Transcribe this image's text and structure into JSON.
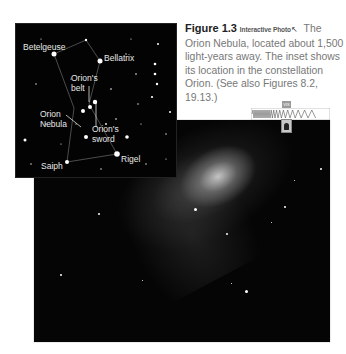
{
  "caption": {
    "figure_number": "Figure 1.3",
    "interactive_label": "Interactive Photo",
    "interactive_icon": "cursor-arrow-icon",
    "text": "The Orion Nebula, located about 1,500 light-years away. The inset shows its location in the constellation Orion. (See also Figures 8.2, 19.13.)"
  },
  "spectrum_indicator": {
    "band_label": "VIS",
    "icon": "eye-icon"
  },
  "inset": {
    "labels": {
      "betelgeuse": "Betelgeuse",
      "bellatrix": "Bellatrix",
      "orions_belt": "Orion's\nbelt",
      "orion_nebula": "Orion\nNebula",
      "orions_sword": "Orion's\nsword",
      "saiph": "Saiph",
      "rigel": "Rigel"
    }
  },
  "colors": {
    "caption_text": "#777777",
    "figure_number": "#222222",
    "background": "#ffffff",
    "photo_bg": "#050505"
  }
}
